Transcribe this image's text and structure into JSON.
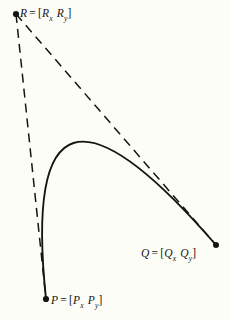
{
  "figure": {
    "name": "parabolic-blend-control-points-diagram",
    "background_color": "#fdfdf8",
    "ink_color": "#141414",
    "labels": {
      "R": {
        "symbol": "R",
        "equals": "=",
        "open_bracket": "[",
        "close_bracket": "]",
        "component_x_base": "R",
        "component_x_sub": "x",
        "component_y_base": "R",
        "component_y_sub": "y",
        "full_text": "R = [Rx Ry]"
      },
      "Q": {
        "symbol": "Q",
        "equals": "=",
        "open_bracket": "[",
        "close_bracket": "]",
        "component_x_base": "Q",
        "component_x_sub": "x",
        "component_y_base": "Q",
        "component_y_sub": "y",
        "full_text": "Q = [Qx Qy]"
      },
      "P": {
        "symbol": "P",
        "equals": "=",
        "open_bracket": "[",
        "close_bracket": "]",
        "component_x_base": "P",
        "component_x_sub": "x",
        "component_y_base": "P",
        "component_y_sub": "y",
        "full_text": "P = [Px Py]"
      }
    }
  },
  "chart_data": {
    "type": "scatter",
    "title": "",
    "xlabel": "",
    "ylabel": "",
    "xlim": [
      0,
      229
    ],
    "ylim": [
      320,
      0
    ],
    "grid": false,
    "legend": null,
    "coordinate_note": "pixel coordinates, y increases downward",
    "points": [
      {
        "name": "R",
        "x": 16,
        "y": 14,
        "marker": "dot",
        "label": "R = [Rx Ry]"
      },
      {
        "name": "Q",
        "x": 216,
        "y": 245,
        "marker": "dot",
        "label": "Q = [Qx Qy]"
      },
      {
        "name": "P",
        "x": 46,
        "y": 299,
        "marker": "dot",
        "label": "P = [Px Py]"
      }
    ],
    "series": [
      {
        "name": "control-polygon-leg-R-P",
        "style": "dashed",
        "x": [
          16,
          46
        ],
        "y": [
          14,
          299
        ]
      },
      {
        "name": "control-polygon-leg-R-Q",
        "style": "dashed",
        "x": [
          16,
          216
        ],
        "y": [
          14,
          245
        ]
      },
      {
        "name": "quadratic-bezier-curve-P-R-Q",
        "style": "solid",
        "curve_type": "quadratic-bezier",
        "start": [
          46,
          299
        ],
        "control": [
          16,
          14
        ],
        "end": [
          216,
          245
        ],
        "apex_approx": [
          113,
          212
        ]
      }
    ]
  }
}
